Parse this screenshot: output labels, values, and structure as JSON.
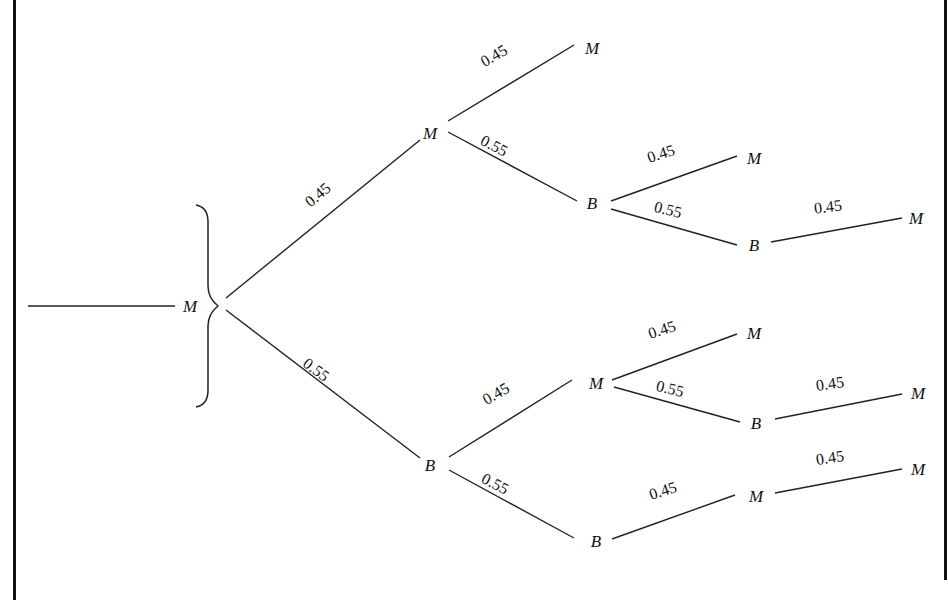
{
  "diagram": {
    "type": "probability-tree",
    "root": {
      "label": "M"
    },
    "nodes": [
      {
        "id": "root",
        "label": "M",
        "x": 190,
        "y": 306
      },
      {
        "id": "n1",
        "label": "M",
        "x": 430,
        "y": 133
      },
      {
        "id": "n2",
        "label": "B",
        "x": 430,
        "y": 465
      },
      {
        "id": "n11",
        "label": "M",
        "x": 592,
        "y": 48
      },
      {
        "id": "n12",
        "label": "B",
        "x": 592,
        "y": 203
      },
      {
        "id": "n121",
        "label": "M",
        "x": 754,
        "y": 158
      },
      {
        "id": "n122",
        "label": "B",
        "x": 754,
        "y": 245
      },
      {
        "id": "n1221",
        "label": "M",
        "x": 916,
        "y": 218
      },
      {
        "id": "n21",
        "label": "M",
        "x": 596,
        "y": 383
      },
      {
        "id": "n22",
        "label": "B",
        "x": 596,
        "y": 541
      },
      {
        "id": "n211",
        "label": "M",
        "x": 754,
        "y": 333
      },
      {
        "id": "n212",
        "label": "B",
        "x": 756,
        "y": 423
      },
      {
        "id": "n2121",
        "label": "M",
        "x": 918,
        "y": 393
      },
      {
        "id": "n221",
        "label": "M",
        "x": 756,
        "y": 496
      },
      {
        "id": "n2211",
        "label": "M",
        "x": 918,
        "y": 469
      }
    ],
    "edges": [
      {
        "from": "root",
        "to": "n1",
        "prob": "0.45",
        "x1": 226,
        "y1": 298,
        "x2": 420,
        "y2": 140,
        "lx": 320,
        "ly": 195,
        "angle": -40
      },
      {
        "from": "root",
        "to": "n2",
        "prob": "0.55",
        "x1": 226,
        "y1": 310,
        "x2": 420,
        "y2": 458,
        "lx": 318,
        "ly": 370,
        "angle": 37
      },
      {
        "from": "n1",
        "to": "n11",
        "prob": "0.45",
        "x1": 448,
        "y1": 121,
        "x2": 574,
        "y2": 45,
        "lx": 496,
        "ly": 56,
        "angle": -30
      },
      {
        "from": "n1",
        "to": "n12",
        "prob": "0.55",
        "x1": 448,
        "y1": 132,
        "x2": 577,
        "y2": 201,
        "lx": 496,
        "ly": 146,
        "angle": 27
      },
      {
        "from": "n12",
        "to": "n121",
        "prob": "0.45",
        "x1": 611,
        "y1": 201,
        "x2": 737,
        "y2": 156,
        "lx": 663,
        "ly": 154,
        "angle": -18
      },
      {
        "from": "n12",
        "to": "n122",
        "prob": "0.55",
        "x1": 611,
        "y1": 209,
        "x2": 737,
        "y2": 245,
        "lx": 670,
        "ly": 210,
        "angle": 14
      },
      {
        "from": "n122",
        "to": "n1221",
        "prob": "0.45",
        "x1": 771,
        "y1": 242,
        "x2": 902,
        "y2": 218,
        "lx": 830,
        "ly": 207,
        "angle": -7
      },
      {
        "from": "n2",
        "to": "n21",
        "prob": "0.45",
        "x1": 449,
        "y1": 457,
        "x2": 572,
        "y2": 380,
        "lx": 498,
        "ly": 394,
        "angle": -30
      },
      {
        "from": "n2",
        "to": "n22",
        "prob": "0.55",
        "x1": 449,
        "y1": 470,
        "x2": 574,
        "y2": 538,
        "lx": 497,
        "ly": 484,
        "angle": 27
      },
      {
        "from": "n21",
        "to": "n211",
        "prob": "0.45",
        "x1": 612,
        "y1": 380,
        "x2": 737,
        "y2": 334,
        "lx": 664,
        "ly": 330,
        "angle": -18
      },
      {
        "from": "n21",
        "to": "n212",
        "prob": "0.55",
        "x1": 614,
        "y1": 387,
        "x2": 740,
        "y2": 422,
        "lx": 672,
        "ly": 389,
        "angle": 14
      },
      {
        "from": "n212",
        "to": "n2121",
        "prob": "0.45",
        "x1": 775,
        "y1": 419,
        "x2": 902,
        "y2": 394,
        "lx": 832,
        "ly": 384,
        "angle": -8
      },
      {
        "from": "n22",
        "to": "n221",
        "prob": "0.45",
        "x1": 612,
        "y1": 539,
        "x2": 735,
        "y2": 495,
        "lx": 665,
        "ly": 491,
        "angle": -18
      },
      {
        "from": "n221",
        "to": "n2211",
        "prob": "0.45",
        "x1": 775,
        "y1": 493,
        "x2": 902,
        "y2": 469,
        "lx": 832,
        "ly": 458,
        "angle": -8
      }
    ],
    "incoming_line": {
      "x1": 28,
      "y1": 306,
      "x2": 175,
      "y2": 306
    }
  }
}
